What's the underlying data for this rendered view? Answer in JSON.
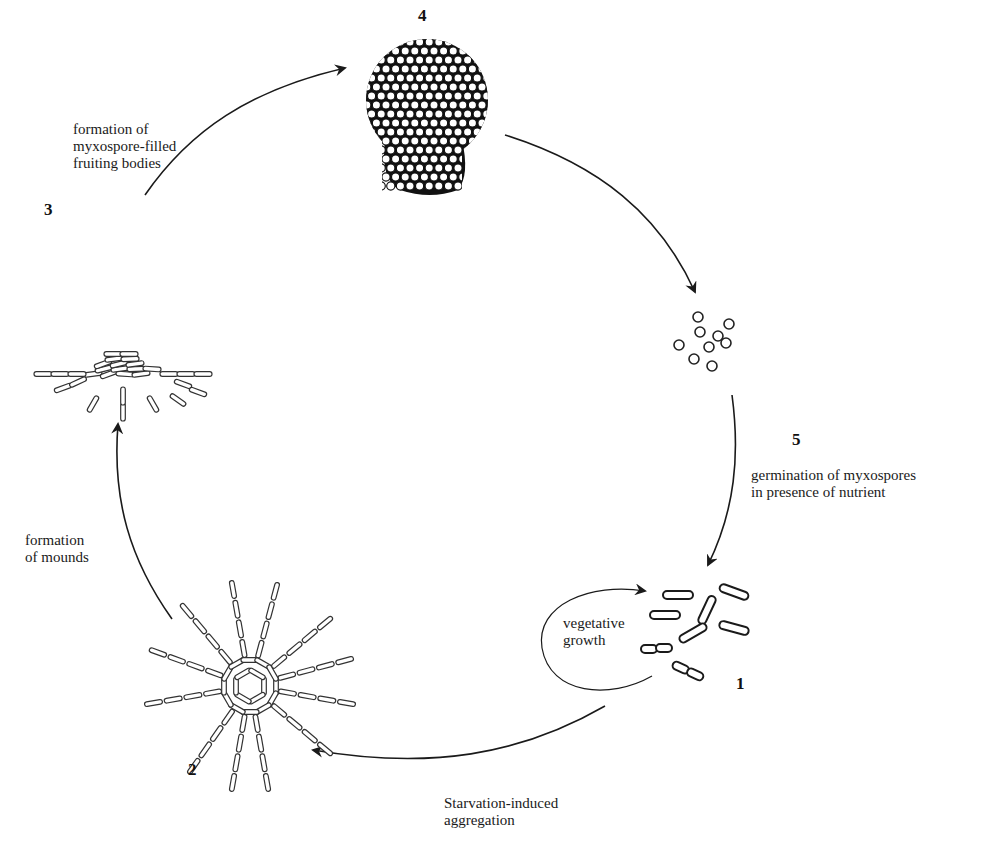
{
  "diagram": {
    "type": "life-cycle",
    "stages": [
      {
        "number": "1",
        "name": "vegetative cells",
        "loop_label": "vegetative\ngrowth"
      },
      {
        "number": "2",
        "name": "aggregation center"
      },
      {
        "number": "3",
        "name": "mound"
      },
      {
        "number": "4",
        "name": "fruiting body"
      },
      {
        "number": "5",
        "name": "myxospores"
      }
    ],
    "transitions": [
      {
        "from": "1",
        "to": "2",
        "label": "Starvation-induced\naggregation"
      },
      {
        "from": "2",
        "to": "3",
        "label": "formation\nof mounds"
      },
      {
        "from": "3",
        "to": "4",
        "label": "formation of\nmyxospore-filled\nfruiting bodies"
      },
      {
        "from": "4",
        "to": "5",
        "label": ""
      },
      {
        "from": "5",
        "to": "1",
        "label": "germination of myxospores\nin presence of nutrient"
      }
    ],
    "colors": {
      "ink": "#1a1a1a",
      "background": "#ffffff"
    }
  }
}
